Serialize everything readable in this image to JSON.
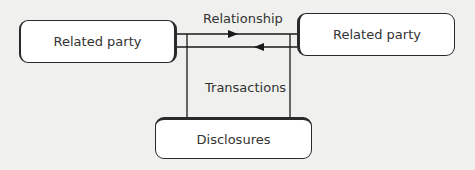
{
  "diagram": {
    "nodes": {
      "left": {
        "label": "Related party"
      },
      "right": {
        "label": "Related party"
      },
      "bottom": {
        "label": "Disclosures"
      }
    },
    "edges": {
      "relationship": {
        "label": "Relationship"
      },
      "transactions": {
        "label": "Transactions"
      }
    },
    "colors": {
      "line": "#1a1a1a",
      "background": "#f0f0ee",
      "box": "#ffffff"
    }
  }
}
